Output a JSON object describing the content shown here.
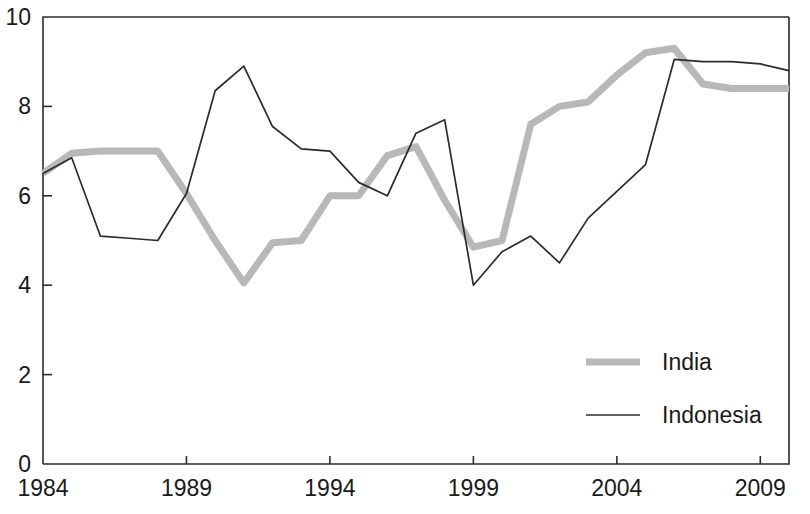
{
  "chart_data": {
    "type": "line",
    "title": "",
    "subtitle": "",
    "xlabel": "",
    "ylabel": "",
    "xlim": [
      1984,
      2010
    ],
    "ylim": [
      0,
      10
    ],
    "grid": false,
    "legend_position": "inside-bottom-right",
    "x_ticks": [
      "1984",
      "1989",
      "1994",
      "1999",
      "2004",
      "2009"
    ],
    "x_tick_values": [
      1984,
      1989,
      1994,
      1999,
      2004,
      2009
    ],
    "y_ticks": [
      "0",
      "2",
      "4",
      "6",
      "8",
      "10"
    ],
    "y_tick_values": [
      0,
      2,
      4,
      6,
      8,
      10
    ],
    "x": [
      1984,
      1985,
      1986,
      1987,
      1988,
      1989,
      1990,
      1991,
      1992,
      1993,
      1994,
      1995,
      1996,
      1997,
      1998,
      1999,
      2000,
      2001,
      2002,
      2003,
      2004,
      2005,
      2006,
      2007,
      2008,
      2009,
      2010
    ],
    "series": [
      {
        "name": "India",
        "color": "#b8b8b8",
        "style": "thick-gray",
        "values": [
          6.5,
          6.95,
          7.0,
          7.0,
          7.0,
          6.05,
          5.0,
          4.05,
          4.95,
          5.0,
          6.0,
          6.0,
          6.9,
          7.1,
          5.9,
          4.85,
          5.0,
          7.6,
          8.0,
          8.1,
          8.7,
          9.2,
          9.3,
          8.5,
          8.4,
          8.4,
          8.4
        ]
      },
      {
        "name": "Indonesia",
        "color": "#2b2b2b",
        "style": "thin-black",
        "values": [
          6.5,
          6.85,
          5.1,
          5.05,
          5.0,
          6.05,
          8.35,
          8.9,
          7.55,
          7.05,
          7.0,
          6.3,
          6.0,
          7.4,
          7.7,
          4.0,
          4.75,
          5.1,
          4.5,
          5.5,
          6.1,
          6.7,
          9.05,
          9.0,
          9.0,
          8.95,
          8.8
        ]
      }
    ]
  },
  "legend": {
    "items": [
      {
        "label": "India",
        "swatch": "thick-gray-line-swatch"
      },
      {
        "label": "Indonesia",
        "swatch": "thin-black-line-swatch"
      }
    ]
  },
  "axes": {
    "x_tick_labels": [
      "1984",
      "1989",
      "1994",
      "1999",
      "2004",
      "2009"
    ],
    "y_tick_labels": [
      "10",
      "8",
      "6",
      "4",
      "2",
      "0"
    ]
  }
}
